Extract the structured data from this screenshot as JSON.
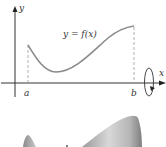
{
  "figure": {
    "axes": {
      "y_label": "y",
      "x_label": "x"
    },
    "curve_label": "y = f(x)",
    "interval": {
      "left_label": "a",
      "right_label": "b"
    },
    "rotation_indicator": "rotate-about-x-axis",
    "solid_of_revolution": {
      "description": "surface generated by rotating y = f(x) about the x-axis"
    },
    "colors": {
      "axis": "#333333",
      "curve": "#8a8a8a",
      "dashed": "#9a9a9a",
      "solid_light": "#e8e8e8",
      "solid_dark": "#8c8c8c"
    }
  }
}
